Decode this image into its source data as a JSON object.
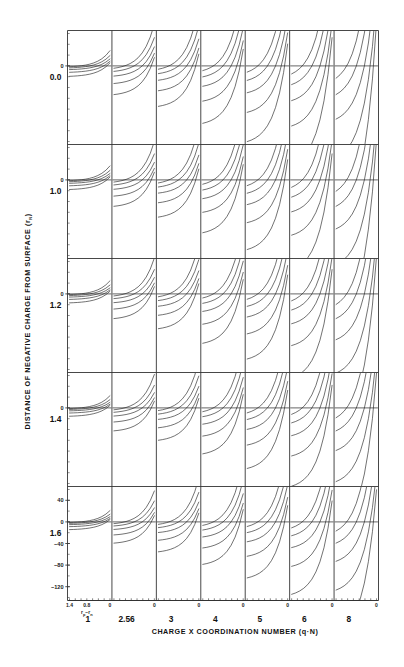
{
  "figure": {
    "title": "",
    "background_color": "#ffffff",
    "line_color": "#1a1a1a",
    "axis_color": "#333333"
  },
  "axes": {
    "y_title": "DISTANCE OF NEGATIVE CHARGE FROM SURFACE",
    "y_title_unit_open": "(",
    "y_title_unit_base": "r",
    "y_title_unit_sub": "N",
    "y_title_unit_close": ")",
    "x_title": "CHARGE X COORDINATION NUMBER",
    "x_title_unit": "(q·N)",
    "panel_x_axis_name": "r",
    "panel_x_axis_sub_p": "p",
    "panel_x_axis_dash": "−",
    "panel_x_axis_sub_n": "n",
    "panel_x_axis_label": "rₚ−rₙ"
  },
  "rows": {
    "labels": [
      "0.0",
      "1.0",
      "1.2",
      "1.4",
      "1.6"
    ],
    "count": 5
  },
  "columns": {
    "labels": [
      "1",
      "2.56",
      "3",
      "4",
      "5",
      "6",
      "8"
    ],
    "count": 7
  },
  "panel_x_ticks": {
    "labels": [
      "1.4",
      "0.8",
      "0"
    ],
    "values": [
      1.4,
      0.8,
      0.0
    ],
    "shown_on_first_row_only": false,
    "shown_at_bottom": true,
    "zero_marker_label": "0"
  },
  "panel_y_ticks": {
    "standard_label": "0",
    "bottom_row_labels": [
      "40",
      "0",
      "−40",
      "−80",
      "−120"
    ],
    "bottom_row_values": [
      40,
      0,
      -40,
      -80,
      -120
    ]
  },
  "chart_data": {
    "type": "line",
    "title": "",
    "subtitle": "",
    "xlabel": "CHARGE X COORDINATION NUMBER (q·N)",
    "ylabel": "DISTANCE OF NEGATIVE CHARGE FROM SURFACE (rN)",
    "grid": false,
    "legend_position": "none",
    "layout": "grid of small multiples, 5 rows x 7 columns",
    "row_variable": "DISTANCE OF NEGATIVE CHARGE FROM SURFACE (rN)",
    "row_values": [
      0.0,
      1.0,
      1.2,
      1.4,
      1.6
    ],
    "column_variable": "CHARGE X COORDINATION NUMBER (q·N)",
    "column_values": [
      1,
      2.56,
      3,
      4,
      5,
      6,
      8
    ],
    "panel_xlabel": "rp − rn",
    "panel_xlim": [
      1.4,
      0.0
    ],
    "panel_xticks": [
      1.4,
      0.8,
      0.0
    ],
    "panel_ylim": [
      -140,
      60
    ],
    "panel_yticks_bottom_row": [
      40,
      0,
      -40,
      -80,
      -120
    ],
    "panel_yticks_other_rows": [
      0
    ],
    "curves_per_panel": 5,
    "curve_family_note": "five curves per panel converging toward rp-rn = 0 at y = 0",
    "series": [
      {
        "name": "curve-1",
        "scale": 0.18
      },
      {
        "name": "curve-2",
        "scale": 0.42
      },
      {
        "name": "curve-3",
        "scale": 0.78
      },
      {
        "name": "curve-4",
        "scale": 1.35
      },
      {
        "name": "curve-5",
        "scale": 2.2
      }
    ],
    "x": [
      1.4,
      1.26,
      1.12,
      0.98,
      0.84,
      0.7,
      0.56,
      0.42,
      0.28,
      0.14,
      0.0
    ],
    "column_amplitude": [
      0.16,
      0.44,
      0.62,
      0.88,
      1.16,
      1.5,
      2.3
    ],
    "row_amplitude": [
      1.0,
      0.92,
      0.86,
      0.8,
      0.74
    ]
  }
}
